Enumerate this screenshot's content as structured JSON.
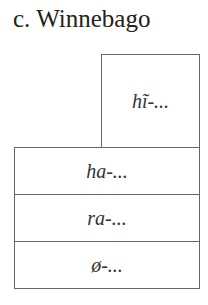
{
  "title": "c.  Winnebago",
  "top_box": {
    "label": "hĩ-..."
  },
  "rows": [
    {
      "label": "ha-..."
    },
    {
      "label": "ra-..."
    },
    {
      "label": "ø-..."
    }
  ]
}
